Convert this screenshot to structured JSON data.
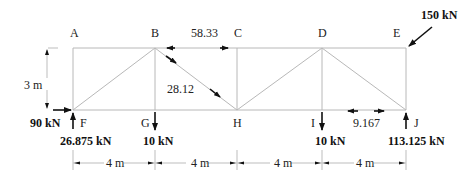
{
  "diagram": {
    "type": "truss",
    "nodes": {
      "top": [
        {
          "id": "A",
          "label": "A"
        },
        {
          "id": "B",
          "label": "B"
        },
        {
          "id": "C",
          "label": "C"
        },
        {
          "id": "D",
          "label": "D"
        },
        {
          "id": "E",
          "label": "E"
        }
      ],
      "bottom": [
        {
          "id": "F",
          "label": "F"
        },
        {
          "id": "G",
          "label": "G"
        },
        {
          "id": "H",
          "label": "H"
        },
        {
          "id": "I",
          "label": "I"
        },
        {
          "id": "J",
          "label": "J"
        }
      ]
    },
    "members": [
      "AB",
      "BC",
      "CD",
      "DE",
      "FG",
      "GH",
      "HI",
      "IJ",
      "AF",
      "BG",
      "CH",
      "DI",
      "EJ",
      "FB",
      "BH",
      "HD",
      "DJ"
    ],
    "member_forces": {
      "BC": "58.33",
      "BH": "28.12",
      "IJ": "9.167"
    },
    "loads": {
      "E_inclined": "150 kN",
      "F_horizontal": "90 kN",
      "F_reaction": "26.875 kN",
      "G_load": "10 kN",
      "I_load": "10 kN",
      "J_reaction": "113.125 kN"
    },
    "dimensions": {
      "height": "3 m",
      "spans": [
        "4 m",
        "4 m",
        "4 m",
        "4 m"
      ]
    }
  }
}
